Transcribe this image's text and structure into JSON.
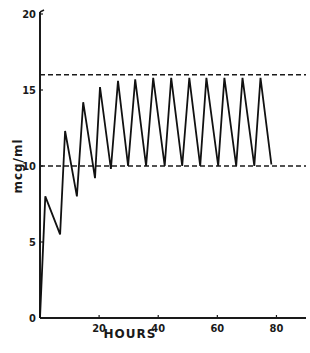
{
  "chart_data": {
    "type": "line",
    "title": "",
    "xlabel": "HOURS",
    "ylabel": "mcg/ml",
    "xlim": [
      0,
      90
    ],
    "ylim": [
      0,
      20
    ],
    "x_ticks": [
      20,
      40,
      60,
      80
    ],
    "x_tick_labels": [
      "20",
      "40",
      "60",
      "80"
    ],
    "y_ticks": [
      0,
      5,
      10,
      15,
      20
    ],
    "y_tick_labels": [
      "0",
      "5",
      "10",
      "15",
      "20"
    ],
    "grid": false,
    "legend": null,
    "series": [
      {
        "name": "concentration",
        "x": [
          0,
          1.8,
          6.8,
          8.5,
          12.5,
          14.6,
          18.6,
          20.3,
          24.0,
          26.4,
          29.8,
          32.2,
          35.9,
          38.3,
          42.2,
          44.4,
          48.1,
          50.5,
          54.2,
          56.3,
          60.3,
          62.4,
          66.4,
          68.5,
          72.5,
          74.6,
          78.3
        ],
        "y": [
          0,
          8.0,
          5.5,
          12.3,
          8.0,
          14.2,
          9.2,
          15.2,
          9.8,
          15.6,
          10.0,
          15.7,
          10.0,
          15.8,
          10.0,
          15.8,
          10.0,
          15.8,
          10.0,
          15.8,
          10.0,
          15.8,
          10.0,
          15.8,
          10.0,
          15.8,
          10.1
        ]
      }
    ],
    "reference_lines": [
      {
        "name": "upper-limit",
        "y": 16,
        "style": "dashed"
      },
      {
        "name": "lower-limit",
        "y": 10,
        "style": "dashed"
      }
    ]
  }
}
